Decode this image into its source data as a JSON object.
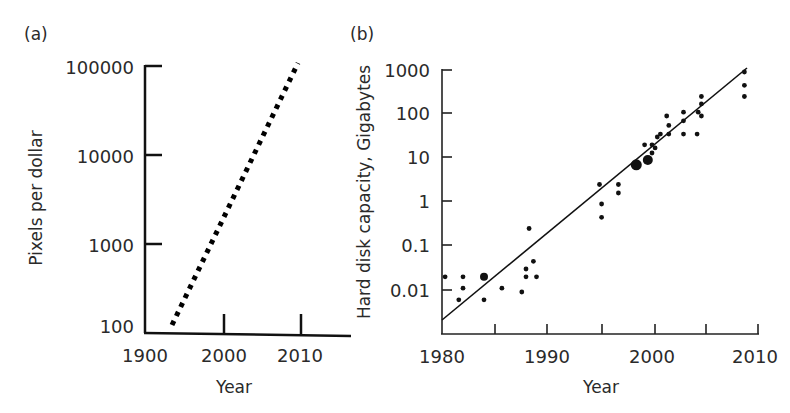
{
  "panels": {
    "a": {
      "label": "(a)"
    },
    "b": {
      "label": "(b)"
    }
  },
  "chart_data": [
    {
      "panel": "(a)",
      "type": "line",
      "title": "",
      "xlabel": "Year",
      "ylabel": "Pixels per dollar",
      "yscale": "log",
      "line_style": "dotted",
      "x_ticks": [
        "1900",
        "2000",
        "2010"
      ],
      "y_ticks": [
        "100",
        "1000",
        "10000",
        "100000"
      ],
      "ylim": [
        100,
        100000
      ],
      "grid": false,
      "series": [
        {
          "name": "Pixels per dollar trend",
          "x": [
            1993,
            2010
          ],
          "y": [
            110,
            100000
          ]
        }
      ]
    },
    {
      "panel": "(b)",
      "type": "scatter",
      "title": "",
      "xlabel": "Year",
      "ylabel": "Hard disk capacity, Gigabytes",
      "yscale": "log",
      "x_ticks": [
        "1980",
        "1990",
        "2000",
        "2010"
      ],
      "x_minor_ticks": [
        1985,
        1995,
        2005
      ],
      "y_ticks": [
        "0.01",
        "0.1",
        "1",
        "10",
        "100",
        "1000"
      ],
      "xlim": [
        1980,
        2010
      ],
      "ylim": [
        0.001,
        1000
      ],
      "grid": false,
      "series": [
        {
          "name": "Hard disk capacity",
          "points": [
            [
              1980.3,
              0.02
            ],
            [
              1981.6,
              0.006
            ],
            [
              1982.0,
              0.02
            ],
            [
              1982.0,
              0.011
            ],
            [
              1984.0,
              0.02
            ],
            [
              1984.0,
              0.006
            ],
            [
              1985.7,
              0.011
            ],
            [
              1987.6,
              0.009
            ],
            [
              1988.0,
              0.03
            ],
            [
              1988.0,
              0.02
            ],
            [
              1988.3,
              0.25
            ],
            [
              1988.7,
              0.045
            ],
            [
              1989.0,
              0.02
            ],
            [
              1995.0,
              2.5
            ],
            [
              1995.2,
              0.9
            ],
            [
              1995.2,
              0.45
            ],
            [
              1996.8,
              2.5
            ],
            [
              1996.8,
              1.6
            ],
            [
              1998.5,
              7
            ],
            [
              1999.3,
              20
            ],
            [
              1999.6,
              9
            ],
            [
              2000.0,
              20
            ],
            [
              2000.0,
              13
            ],
            [
              2000.3,
              17
            ],
            [
              2000.5,
              30
            ],
            [
              2000.8,
              35
            ],
            [
              2001.4,
              90
            ],
            [
              2001.6,
              55
            ],
            [
              2001.6,
              35
            ],
            [
              2003.0,
              110
            ],
            [
              2003.0,
              70
            ],
            [
              2003.0,
              35
            ],
            [
              2004.3,
              35
            ],
            [
              2004.4,
              110
            ],
            [
              2004.7,
              250
            ],
            [
              2004.7,
              170
            ],
            [
              2004.7,
              90
            ],
            [
              2008.8,
              900
            ],
            [
              2008.8,
              450
            ],
            [
              2008.8,
              250
            ]
          ]
        },
        {
          "name": "Trend line",
          "type": "line",
          "x": [
            1980,
            2009.5
          ],
          "y": [
            0.002,
            850
          ]
        }
      ]
    }
  ]
}
